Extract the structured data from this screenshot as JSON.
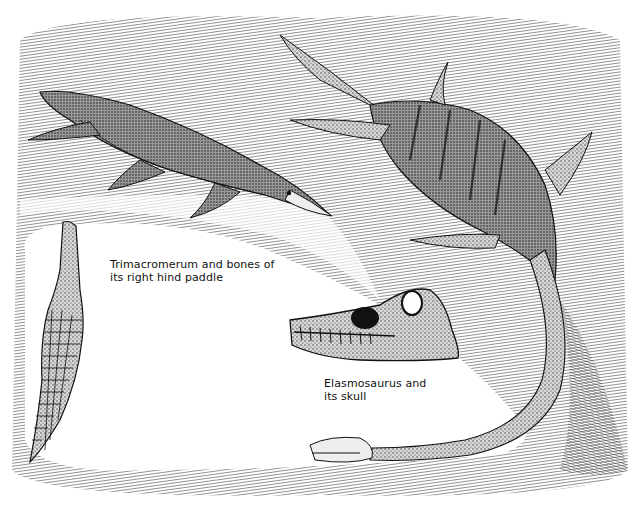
{
  "illustration": {
    "style": "black-and-white pen and ink drawing",
    "ink_color": "#111111",
    "paper_color": "#ffffff",
    "subjects": [
      {
        "name": "Trimacromerum",
        "kind": "short-necked plesiosaur swimming"
      },
      {
        "name": "Trimacromerum right hind paddle bones"
      },
      {
        "name": "Elasmosaurus",
        "kind": "long-necked plesiosaur"
      },
      {
        "name": "Elasmosaurus skull"
      }
    ]
  },
  "captions": {
    "trimacromerum": {
      "line1": "Trimacromerum and bones of",
      "line2": "its right hind paddle"
    },
    "elasmosaurus": {
      "line1": "Elasmosaurus and",
      "line2": "its skull"
    }
  }
}
